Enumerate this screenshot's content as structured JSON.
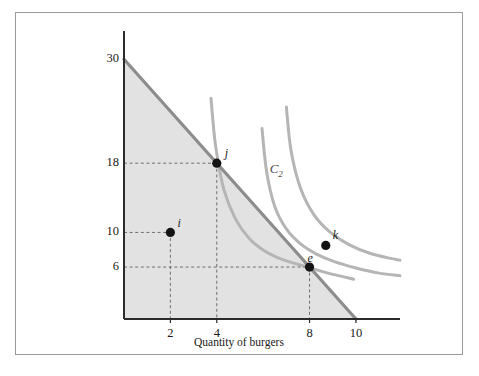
{
  "figure": {
    "background": "#ffffff",
    "border_color": "#9a9a9a"
  },
  "chart_data": {
    "type": "line",
    "title": "",
    "xlabel": "Quantity of burgers",
    "ylabel": "Quantity of tacos",
    "xlim": [
      0,
      11.9
    ],
    "ylim": [
      0,
      33.5
    ],
    "grid": false,
    "legend": "none",
    "xticks": [
      2,
      4,
      8,
      10
    ],
    "xticklabels": [
      "2",
      "4",
      "8",
      "10"
    ],
    "yticks": [
      6,
      10,
      18,
      30
    ],
    "yticklabels": [
      "6",
      "10",
      "18",
      "30"
    ],
    "series": [
      {
        "name": "budget-line",
        "type": "line",
        "color": "#8c8c8c",
        "x": [
          0,
          10
        ],
        "y": [
          30,
          0
        ],
        "fill_below": true,
        "fill_color": "#e2e2e2"
      },
      {
        "name": "indifference-curve-1",
        "type": "curve",
        "color": "#b5b5b5",
        "through_points": [
          "j",
          "e"
        ],
        "x": [
          3.75,
          3.95,
          4.3,
          4.8,
          5.4,
          6.1,
          6.9,
          7.8,
          8.8,
          9.9
        ],
        "y": [
          25.5,
          20.0,
          15.0,
          11.6,
          9.3,
          7.8,
          6.8,
          6.1,
          5.3,
          4.6
        ]
      },
      {
        "name": "indifference-curve-2",
        "type": "curve",
        "color": "#b5b5b5",
        "label": "C2",
        "x": [
          5.95,
          6.15,
          6.5,
          7.0,
          7.6,
          8.3,
          9.1,
          10.0,
          11.0,
          11.9
        ],
        "y": [
          22.0,
          17.0,
          13.0,
          10.4,
          8.7,
          7.5,
          6.6,
          5.9,
          5.3,
          5.0
        ]
      },
      {
        "name": "indifference-curve-3",
        "type": "curve",
        "color": "#b5b5b5",
        "through_points": [
          "k"
        ],
        "x": [
          7.0,
          7.2,
          7.6,
          8.2,
          8.9,
          9.7,
          10.6,
          11.5,
          11.9
        ],
        "y": [
          24.5,
          19.5,
          15.2,
          12.0,
          10.0,
          8.6,
          7.6,
          7.0,
          6.8
        ]
      }
    ],
    "points": [
      {
        "label": "i",
        "x": 2,
        "y": 10,
        "color": "#141414",
        "label_dx": 7,
        "label_dy": -16,
        "guides": true
      },
      {
        "label": "j",
        "x": 4,
        "y": 18,
        "color": "#141414",
        "label_dx": 8,
        "label_dy": -17,
        "guides": true
      },
      {
        "label": "e",
        "x": 8,
        "y": 6,
        "color": "#141414",
        "label_dx": -2,
        "label_dy": -16,
        "guides": true
      },
      {
        "label": "k",
        "x": 8.7,
        "y": 8.5,
        "color": "#141414",
        "label_dx": 7,
        "label_dy": -17,
        "guides": false
      }
    ],
    "annotations": [
      {
        "name": "curve-label-c2",
        "text_main": "C",
        "text_sub": "2",
        "x": 6.28,
        "y": 17.2
      }
    ],
    "axis_color": "#2b2b2b",
    "guide_color": "#6e6e6e"
  }
}
